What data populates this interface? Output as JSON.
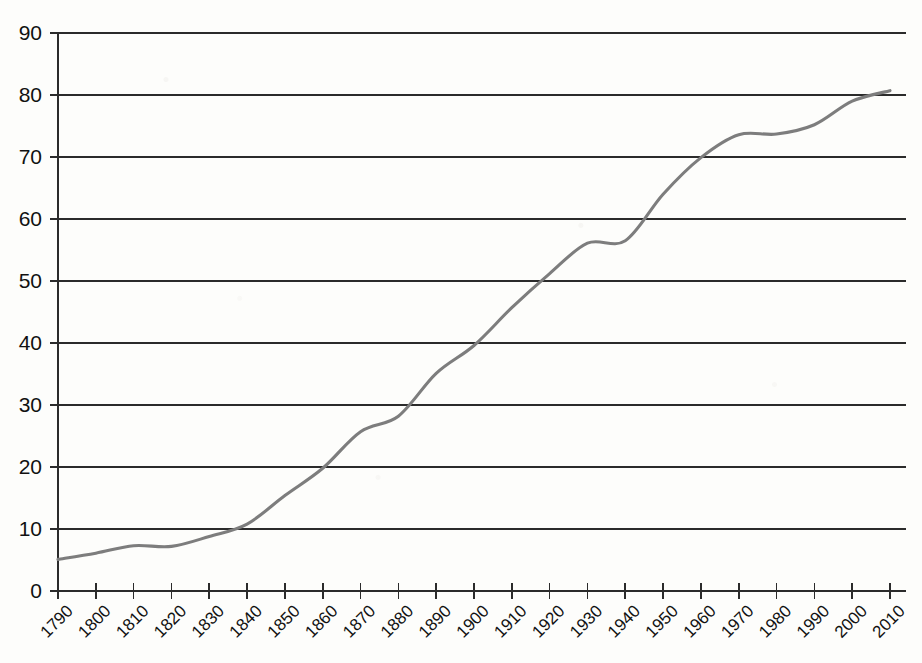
{
  "chart_data": {
    "type": "line",
    "title": "",
    "subtitle": "",
    "xlabel": "",
    "ylabel": "",
    "grid": "horizontal",
    "legend": "none",
    "xlim": [
      1790,
      2010
    ],
    "ylim": [
      0,
      90
    ],
    "ytick_step": 10,
    "xtick_step": 10,
    "x": [
      1790,
      1800,
      1810,
      1820,
      1830,
      1840,
      1850,
      1860,
      1870,
      1880,
      1890,
      1900,
      1910,
      1920,
      1930,
      1940,
      1950,
      1960,
      1970,
      1980,
      1990,
      2000,
      2010
    ],
    "xtick_labels": [
      "1790",
      "1800",
      "1810",
      "1820",
      "1830",
      "1840",
      "1850",
      "1860",
      "1870",
      "1880",
      "1890",
      "1900",
      "1910",
      "1920",
      "1930",
      "1940",
      "1950",
      "1960",
      "1970",
      "1980",
      "1990",
      "2000",
      "2010"
    ],
    "ytick_labels": [
      "0",
      "10",
      "20",
      "30",
      "40",
      "50",
      "60",
      "70",
      "80",
      "90"
    ],
    "ytick_values": [
      0,
      10,
      20,
      30,
      40,
      50,
      60,
      70,
      80,
      90
    ],
    "series": [
      {
        "name": "series-1",
        "color": "#7d7d7d",
        "values": [
          5.1,
          6.1,
          7.3,
          7.2,
          8.8,
          10.8,
          15.4,
          19.8,
          25.7,
          28.2,
          35.1,
          39.6,
          45.7,
          51.2,
          56.1,
          56.5,
          64.0,
          69.9,
          73.6,
          73.7,
          75.2,
          79.0,
          80.7
        ]
      }
    ]
  },
  "axis": {
    "y_axis_name": "y-axis",
    "x_axis_name": "x-axis"
  }
}
